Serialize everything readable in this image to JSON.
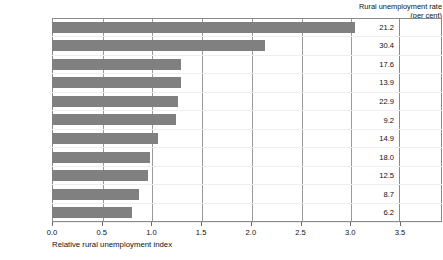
{
  "chart_data": {
    "type": "bar",
    "orientation": "horizontal",
    "title": "",
    "xlabel": "Relative rural unemployment index",
    "ylabel": "",
    "xlim": [
      0.0,
      3.5
    ],
    "xticks": [
      "0.0",
      "0.5",
      "1.0",
      "1.5",
      "2.0",
      "2.5",
      "3.0",
      "3.5"
    ],
    "xtick_values": [
      0.0,
      0.5,
      1.0,
      1.5,
      2.0,
      2.5,
      3.0,
      3.5
    ],
    "grid": true,
    "legend": "none",
    "bar_color": "#808080",
    "value_column_header_line1": "Rural unemployment rate",
    "value_column_header_line2": "(per cent)",
    "categories": [
      "Slovak Rep.",
      "Russia",
      "Lithuania",
      "Estonia",
      "Bulgaria",
      "Hungary",
      "Latvia",
      "Poland",
      "Ukraine",
      "Czech Rep.",
      "Romania"
    ],
    "values": [
      3.05,
      2.14,
      1.3,
      1.3,
      1.27,
      1.25,
      1.07,
      0.99,
      0.97,
      0.88,
      0.8
    ],
    "value_labels": [
      "21.2",
      "30.4",
      "17.6",
      "13.9",
      "22.9",
      "9.2",
      "14.9",
      "18.0",
      "12.5",
      "8.7",
      "6.2"
    ],
    "rows": [
      {
        "category": "Slovak Rep.",
        "index": 3.05,
        "rate": "21.2"
      },
      {
        "category": "Russia",
        "index": 2.14,
        "rate": "30.4"
      },
      {
        "category": "Lithuania",
        "index": 1.3,
        "rate": "17.6"
      },
      {
        "category": "Estonia",
        "index": 1.3,
        "rate": "13.9"
      },
      {
        "category": "Bulgaria",
        "index": 1.27,
        "rate": "22.9"
      },
      {
        "category": "Hungary",
        "index": 1.25,
        "rate": "9.2"
      },
      {
        "category": "Latvia",
        "index": 1.07,
        "rate": "14.9"
      },
      {
        "category": "Poland",
        "index": 0.99,
        "rate": "18.0"
      },
      {
        "category": "Ukraine",
        "index": 0.97,
        "rate": "12.5"
      },
      {
        "category": "Czech Rep.",
        "index": 0.88,
        "rate": "8.7"
      },
      {
        "category": "Romania",
        "index": 0.8,
        "rate": "6.2"
      }
    ]
  }
}
